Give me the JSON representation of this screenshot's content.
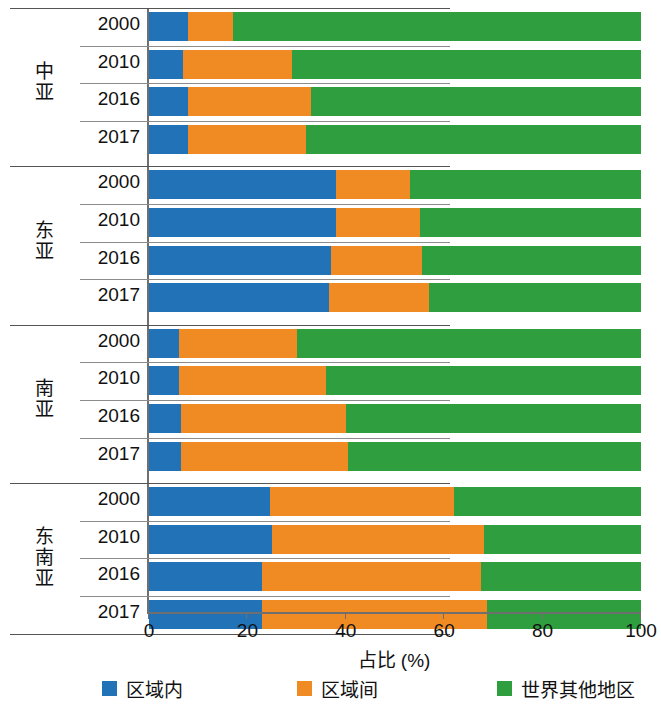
{
  "chart_data": {
    "type": "bar",
    "orientation": "horizontal",
    "stacked": true,
    "stack_mode": "percent",
    "title": "",
    "xlabel": "占比 (%)",
    "ylabel": "",
    "xlim": [
      0,
      100
    ],
    "xticks": [
      0,
      20,
      40,
      60,
      80,
      100
    ],
    "xtick_labels": [
      "0",
      "20",
      "40",
      "60",
      "80",
      "100"
    ],
    "grid": false,
    "legend_position": "bottom",
    "series": [
      {
        "name": "区域内",
        "color": "#2272b8"
      },
      {
        "name": "区域间",
        "color": "#f08a23"
      },
      {
        "name": "世界其他地区",
        "color": "#2e9e3e"
      }
    ],
    "groups": [
      {
        "label": "中亚",
        "label_chars": [
          "中",
          "亚"
        ],
        "rows": [
          {
            "year": "2000",
            "values": [
              8,
              9,
              83
            ]
          },
          {
            "year": "2010",
            "values": [
              7,
              22,
              71
            ]
          },
          {
            "year": "2016",
            "values": [
              8,
              25,
              67
            ]
          },
          {
            "year": "2017",
            "values": [
              8,
              24,
              68
            ]
          }
        ]
      },
      {
        "label": "东亚",
        "label_chars": [
          "东",
          "亚"
        ],
        "rows": [
          {
            "year": "2000",
            "values": [
              38,
              15,
              47
            ]
          },
          {
            "year": "2010",
            "values": [
              38,
              17,
              45
            ]
          },
          {
            "year": "2016",
            "values": [
              37,
              18.5,
              44.5
            ]
          },
          {
            "year": "2017",
            "values": [
              36.5,
              20.5,
              43
            ]
          }
        ]
      },
      {
        "label": "南亚",
        "label_chars": [
          "南",
          "亚"
        ],
        "rows": [
          {
            "year": "2000",
            "values": [
              6,
              24,
              70
            ]
          },
          {
            "year": "2010",
            "values": [
              6,
              30,
              64
            ]
          },
          {
            "year": "2016",
            "values": [
              6.5,
              33.5,
              60
            ]
          },
          {
            "year": "2017",
            "values": [
              6.5,
              34,
              59.5
            ]
          }
        ]
      },
      {
        "label": "东南亚",
        "label_chars": [
          "东",
          "南",
          "亚"
        ],
        "rows": [
          {
            "year": "2000",
            "values": [
              24.5,
              37.5,
              38
            ]
          },
          {
            "year": "2010",
            "values": [
              25,
              43,
              32
            ]
          },
          {
            "year": "2016",
            "values": [
              23,
              44.5,
              32.5
            ]
          },
          {
            "year": "2017",
            "values": [
              23,
              45.6,
              31.4
            ]
          }
        ]
      }
    ]
  }
}
